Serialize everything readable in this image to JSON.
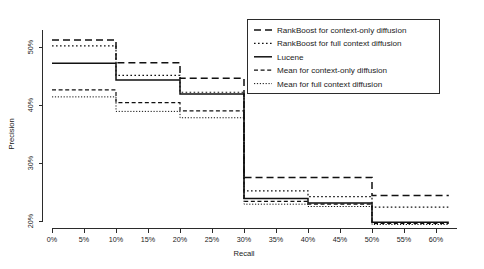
{
  "chart_data": {
    "type": "line",
    "title": "",
    "xlabel": "Recall",
    "ylabel": "Precision",
    "grid": false,
    "legend_position": "top-right",
    "xlim": [
      -0.5,
      63.5
    ],
    "ylim": [
      18.5,
      52.5
    ],
    "xticks": [
      "0%",
      "5%",
      "10%",
      "15%",
      "20%",
      "25%",
      "30%",
      "35%",
      "40%",
      "45%",
      "50%",
      "55%",
      "60%"
    ],
    "xtick_values": [
      0,
      5,
      10,
      15,
      20,
      25,
      30,
      35,
      40,
      45,
      50,
      55,
      60
    ],
    "yticks": [
      "20%",
      "30%",
      "40%",
      "50%"
    ],
    "ytick_values": [
      20,
      30,
      40,
      50
    ],
    "step_style": "post",
    "x": [
      0,
      5,
      10,
      15,
      20,
      25,
      30,
      35,
      40,
      45,
      50,
      55,
      60,
      62
    ],
    "series": [
      {
        "name": "RankBoost for context-only diffusion",
        "dash": "long-dash",
        "values": [
          51.2,
          51.2,
          47.3,
          47.3,
          44.6,
          44.6,
          27.5,
          27.5,
          27.5,
          27.5,
          24.4,
          24.4,
          24.4,
          24.4
        ]
      },
      {
        "name": "RankBoost for full context diffusion",
        "dash": "fine-dot",
        "values": [
          50.2,
          50.2,
          45.1,
          45.1,
          42.2,
          42.2,
          25.2,
          25.2,
          24.2,
          24.2,
          22.4,
          22.4,
          22.4,
          22.4
        ]
      },
      {
        "name": "Lucene",
        "dash": "solid",
        "values": [
          47.2,
          47.2,
          44.3,
          44.3,
          41.9,
          41.9,
          23.9,
          23.9,
          23.1,
          23.1,
          19.8,
          19.8,
          19.8,
          19.8
        ]
      },
      {
        "name": "Mean for context-only diffusion",
        "dash": "short-dash",
        "values": [
          42.6,
          42.6,
          40.4,
          40.4,
          39.0,
          39.0,
          23.4,
          23.4,
          22.9,
          22.9,
          19.6,
          19.6,
          19.6,
          19.6
        ]
      },
      {
        "name": "Mean for full context diffusion",
        "dash": "dense-dot",
        "values": [
          41.4,
          41.4,
          38.9,
          38.9,
          37.8,
          37.8,
          22.9,
          22.9,
          22.5,
          22.5,
          19.4,
          19.4,
          19.4,
          19.4
        ]
      }
    ]
  },
  "legend": {
    "entries": [
      {
        "label": "RankBoost for context-only diffusion",
        "dash": "long-dash"
      },
      {
        "label": "RankBoost for full context diffusion",
        "dash": "fine-dot"
      },
      {
        "label": "Lucene",
        "dash": "solid"
      },
      {
        "label": "Mean for context-only diffusion",
        "dash": "short-dash"
      },
      {
        "label": "Mean for full context diffusion",
        "dash": "dense-dot"
      }
    ]
  },
  "colors": {
    "line": "#111111",
    "axis": "#2b2b2b",
    "text": "#1a1a1a",
    "background": "#ffffff"
  }
}
